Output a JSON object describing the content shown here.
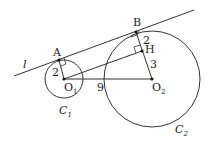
{
  "diagram": {
    "line_label": "l",
    "circles": [
      {
        "name": "C",
        "sub": "1",
        "center": "O",
        "center_sub": "1",
        "radius_label": "2"
      },
      {
        "name": "C",
        "sub": "2",
        "center": "O",
        "center_sub": "2"
      }
    ],
    "points": {
      "A": "A",
      "B": "B",
      "H": "H"
    },
    "segments": {
      "BH": "2",
      "HO2": "3",
      "O1O2": "9"
    },
    "colors": {
      "stroke": "#333333",
      "background": "#ffffff"
    }
  }
}
